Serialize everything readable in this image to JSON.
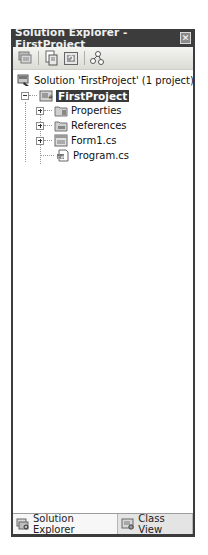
{
  "window": {
    "title": "Solution Explorer - FirstProject",
    "close_icon": "close-icon"
  },
  "toolbar": {
    "buttons": [
      {
        "name": "show-all-files",
        "icon": "show-all-files-icon"
      },
      {
        "name": "properties",
        "icon": "properties-icon"
      },
      {
        "name": "refresh",
        "icon": "refresh-icon"
      },
      {
        "name": "view-class-diagram",
        "icon": "class-diagram-icon"
      }
    ]
  },
  "tree": {
    "solution": {
      "label": "Solution 'FirstProject' (1 project)",
      "icon": "solution-icon"
    },
    "project": {
      "label": "FirstProject",
      "icon": "csharp-project-icon",
      "expanded": true,
      "selected": true
    },
    "items": [
      {
        "label": "Properties",
        "icon": "properties-folder-icon",
        "expandable": true
      },
      {
        "label": "References",
        "icon": "references-folder-icon",
        "expandable": true
      },
      {
        "label": "Form1.cs",
        "icon": "form-icon",
        "expandable": true
      },
      {
        "label": "Program.cs",
        "icon": "csharp-file-icon",
        "expandable": false
      }
    ]
  },
  "tabs": [
    {
      "label": "Solution Explorer",
      "icon": "solution-explorer-icon",
      "active": true
    },
    {
      "label": "Class View",
      "icon": "class-view-icon",
      "active": false
    }
  ]
}
